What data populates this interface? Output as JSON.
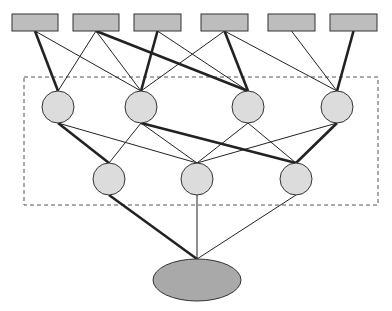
{
  "colors": {
    "input_fill": "#bdbdbd",
    "hidden_fill": "#dcdcdc",
    "output_fill": "#a9a9a9",
    "stroke": "#333333",
    "edge": "#222222",
    "dashed_box": "#555555"
  },
  "dashed_box": {
    "x": 24,
    "y": 77,
    "w": 354,
    "h": 128
  },
  "input_nodes": [
    {
      "id": "R1",
      "x": 12,
      "y": 14,
      "w": 46,
      "h": 17
    },
    {
      "id": "R2",
      "x": 73,
      "y": 14,
      "w": 46,
      "h": 17
    },
    {
      "id": "R3",
      "x": 134,
      "y": 14,
      "w": 47,
      "h": 17
    },
    {
      "id": "R4",
      "x": 201,
      "y": 14,
      "w": 47,
      "h": 17
    },
    {
      "id": "R5",
      "x": 268,
      "y": 14,
      "w": 47,
      "h": 17
    },
    {
      "id": "R6",
      "x": 330,
      "y": 14,
      "w": 47,
      "h": 17
    }
  ],
  "hidden_layer_1": [
    {
      "id": "C1",
      "cx": 58,
      "cy": 107,
      "r": 16
    },
    {
      "id": "C2",
      "cx": 141,
      "cy": 107,
      "r": 16
    },
    {
      "id": "C3",
      "cx": 248,
      "cy": 107,
      "r": 16
    },
    {
      "id": "C4",
      "cx": 337,
      "cy": 107,
      "r": 16
    }
  ],
  "hidden_layer_2": [
    {
      "id": "L1",
      "cx": 109,
      "cy": 179,
      "r": 16
    },
    {
      "id": "L2",
      "cx": 197,
      "cy": 179,
      "r": 16
    },
    {
      "id": "L3",
      "cx": 296,
      "cy": 179,
      "r": 16
    }
  ],
  "output_node": {
    "id": "OUT",
    "cx": 197,
    "cy": 280,
    "rx": 44,
    "ry": 21
  },
  "edges": [
    {
      "from": "R1",
      "to": "C1",
      "weight": "thick"
    },
    {
      "from": "R1",
      "to": "C2",
      "weight": "thin"
    },
    {
      "from": "R2",
      "to": "C1",
      "weight": "thin"
    },
    {
      "from": "R2",
      "to": "C2",
      "weight": "thin"
    },
    {
      "from": "R2",
      "to": "C3",
      "weight": "thick"
    },
    {
      "from": "R3",
      "to": "C2",
      "weight": "thick"
    },
    {
      "from": "R3",
      "to": "C3",
      "weight": "thin"
    },
    {
      "from": "R4",
      "to": "C2",
      "weight": "thin"
    },
    {
      "from": "R4",
      "to": "C3",
      "weight": "thick"
    },
    {
      "from": "R4",
      "to": "C4",
      "weight": "thin"
    },
    {
      "from": "R5",
      "to": "C4",
      "weight": "thin"
    },
    {
      "from": "R6",
      "to": "C4",
      "weight": "thick"
    },
    {
      "from": "C1",
      "to": "L1",
      "weight": "thick"
    },
    {
      "from": "C1",
      "to": "L2",
      "weight": "thin"
    },
    {
      "from": "C2",
      "to": "L1",
      "weight": "thin"
    },
    {
      "from": "C2",
      "to": "L2",
      "weight": "thin"
    },
    {
      "from": "C2",
      "to": "L3",
      "weight": "thick"
    },
    {
      "from": "C3",
      "to": "L2",
      "weight": "thin"
    },
    {
      "from": "C3",
      "to": "L3",
      "weight": "thin"
    },
    {
      "from": "C4",
      "to": "L2",
      "weight": "thin"
    },
    {
      "from": "C4",
      "to": "L3",
      "weight": "thick"
    },
    {
      "from": "L1",
      "to": "OUT",
      "weight": "thick"
    },
    {
      "from": "L2",
      "to": "OUT",
      "weight": "thin"
    },
    {
      "from": "L3",
      "to": "OUT",
      "weight": "thin"
    }
  ]
}
